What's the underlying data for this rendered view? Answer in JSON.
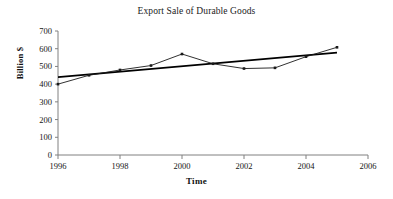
{
  "chart_data": {
    "type": "line",
    "title": "Export Sale of Durable Goods",
    "xlabel": "Time",
    "ylabel": "Billion $",
    "grid": false,
    "legend": "none",
    "xlim": [
      1996,
      2006
    ],
    "ylim": [
      0,
      700
    ],
    "xticks": [
      "1996",
      "1998",
      "2000",
      "2002",
      "2004",
      "2006"
    ],
    "xtick_values": [
      1996,
      1998,
      2000,
      2002,
      2004,
      2006
    ],
    "yticks": [
      "0",
      "100",
      "200",
      "300",
      "400",
      "500",
      "600",
      "700"
    ],
    "ytick_values": [
      0,
      100,
      200,
      300,
      400,
      500,
      600,
      700
    ],
    "x": [
      1996,
      1997,
      1998,
      1999,
      2000,
      2001,
      2002,
      2003,
      2004,
      2005
    ],
    "series": [
      {
        "name": "Export Sale",
        "type": "line-markers",
        "color": "#1a1a1a",
        "values": [
          400,
          450,
          480,
          505,
          570,
          515,
          488,
          492,
          555,
          608
        ]
      },
      {
        "name": "Linear Trend",
        "type": "trendline",
        "color": "#000000",
        "x": [
          1996,
          2005
        ],
        "values": [
          440,
          578
        ]
      }
    ]
  },
  "axes": {
    "axis_color": "#808080",
    "tick_color": "#808080"
  }
}
